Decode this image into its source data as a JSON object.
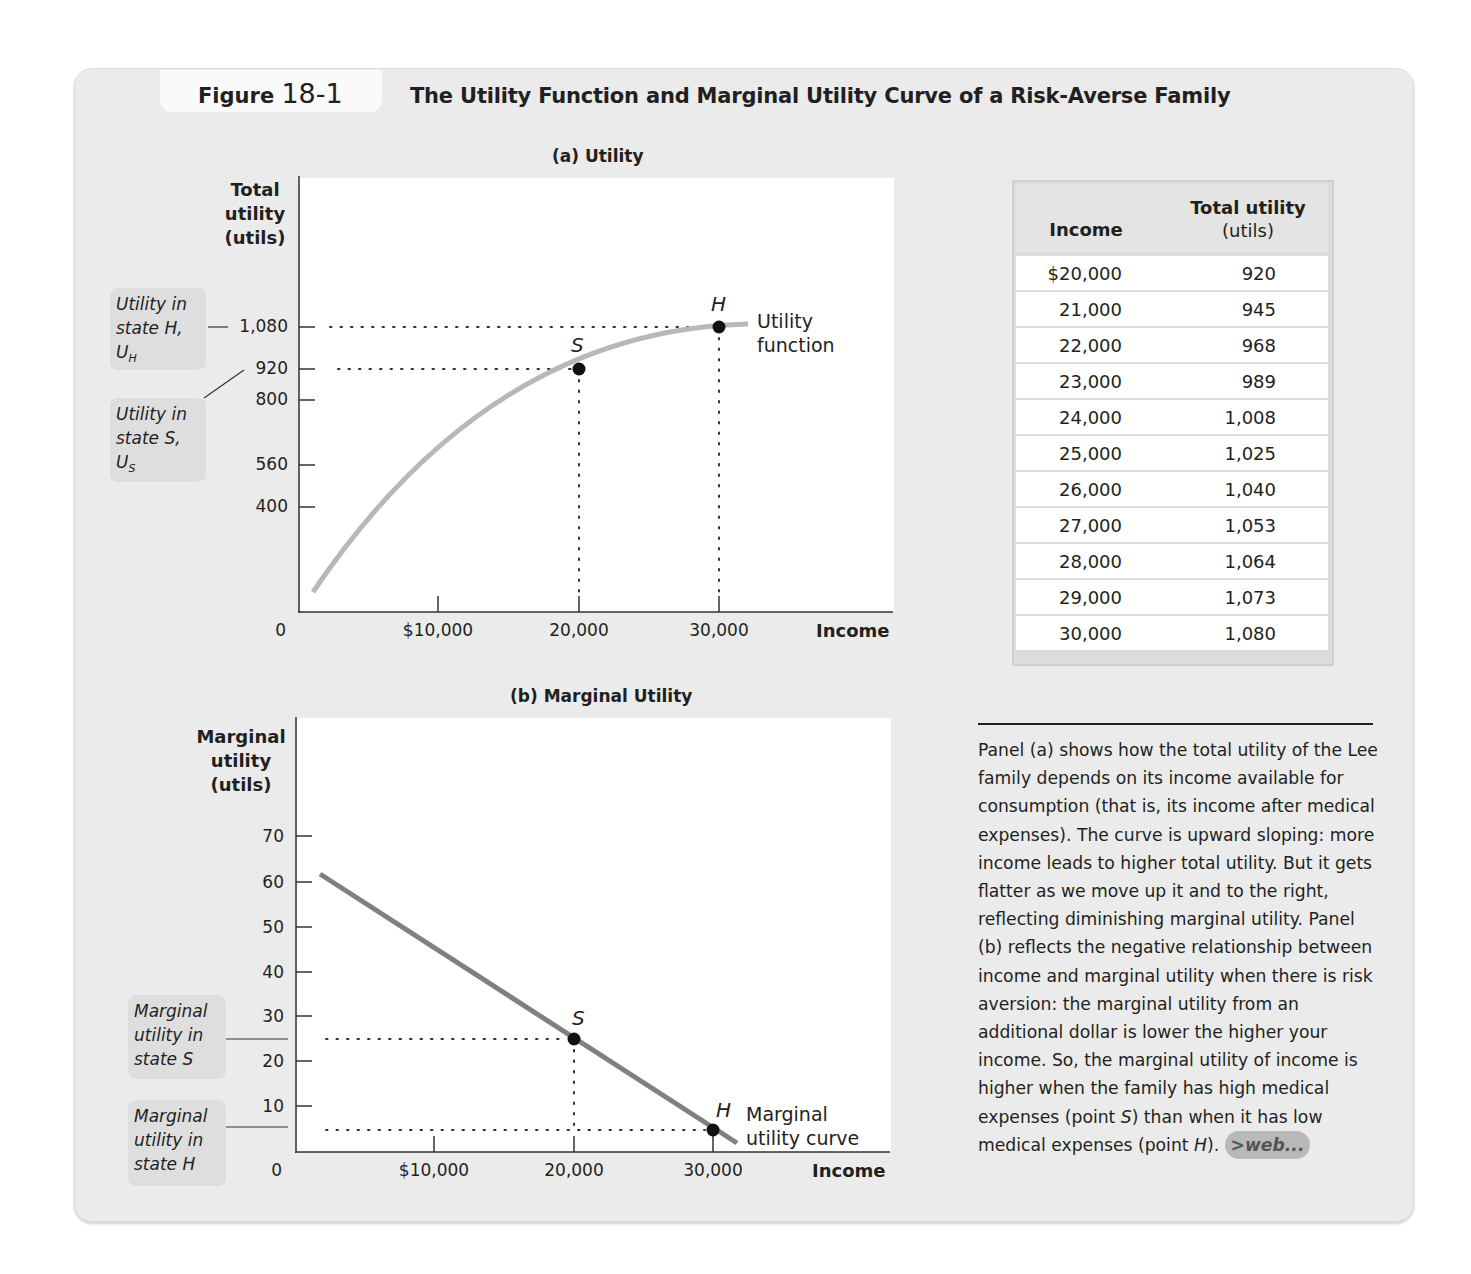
{
  "figure": {
    "label": "Figure",
    "number": "18-1",
    "title": "The Utility Function and Marginal Utility Curve of a Risk-Averse Family"
  },
  "panel_a": {
    "title": "(a) Utility",
    "y_axis_title": [
      "Total",
      "utility",
      "(utils)"
    ],
    "y_ticks": [
      "1,080",
      "920",
      "800",
      "560",
      "400"
    ],
    "origin": "0",
    "x_ticks": [
      "$10,000",
      "20,000",
      "30,000"
    ],
    "x_axis_title": "Income",
    "point_s": "S",
    "point_h": "H",
    "curve_label": [
      "Utility",
      "function"
    ],
    "callout_h": [
      "Utility in",
      "state H,",
      "U",
      "H"
    ],
    "callout_s": [
      "Utility in",
      "state S,",
      "U",
      "S"
    ]
  },
  "panel_b": {
    "title": "(b) Marginal Utility",
    "y_axis_title": [
      "Marginal",
      "utility",
      "(utils)"
    ],
    "y_ticks": [
      "70",
      "60",
      "50",
      "40",
      "30",
      "20",
      "10"
    ],
    "origin": "0",
    "x_ticks": [
      "$10,000",
      "20,000",
      "30,000"
    ],
    "x_axis_title": "Income",
    "point_s": "S",
    "point_h": "H",
    "curve_label": [
      "Marginal",
      "utility curve"
    ],
    "callout_s": [
      "Marginal",
      "utility in",
      "state S"
    ],
    "callout_h": [
      "Marginal",
      "utility in",
      "state H"
    ]
  },
  "table": {
    "headers": [
      "Income",
      "Total utility",
      "(utils)"
    ],
    "rows": [
      [
        "$20,000",
        "920"
      ],
      [
        "21,000",
        "945"
      ],
      [
        "22,000",
        "968"
      ],
      [
        "23,000",
        "989"
      ],
      [
        "24,000",
        "1,008"
      ],
      [
        "25,000",
        "1,025"
      ],
      [
        "26,000",
        "1,040"
      ],
      [
        "27,000",
        "1,053"
      ],
      [
        "28,000",
        "1,064"
      ],
      [
        "29,000",
        "1,073"
      ],
      [
        "30,000",
        "1,080"
      ]
    ]
  },
  "caption": {
    "part1": "Panel (a) shows how the total utility of the Lee family depends on its income available for consumption (that is, its income after medical expenses). The curve is upward sloping: more income leads to higher total utility. But it gets flatter as we move up it and to the right, reflecting diminishing marginal utility. Panel (b) reflects the negative relationship between income and marginal utility when there is risk aversion: the marginal utility from an additional dollar is lower the higher your income. So, the marginal utility of income is higher when the family has high medical expenses (point ",
    "s": "S",
    "part2": ") than when it has low medical expenses (point ",
    "h": "H",
    "part3": ").",
    "web_link": ">web..."
  },
  "colors": {
    "background": "#ebebeb",
    "curve_a": "#b8b8b8",
    "curve_b": "#808080",
    "point": "#111111"
  },
  "chart_data": [
    {
      "type": "line",
      "title": "(a) Utility",
      "xlabel": "Income",
      "ylabel": "Total utility (utils)",
      "x_ticks": [
        10000,
        20000,
        30000
      ],
      "y_ticks": [
        400,
        560,
        800,
        920,
        1080
      ],
      "series": [
        {
          "name": "Utility function",
          "x": [
            1000,
            5000,
            10000,
            15000,
            20000,
            25000,
            30000,
            32000
          ],
          "y": [
            150,
            380,
            590,
            770,
            920,
            1025,
            1080,
            1090
          ]
        }
      ],
      "points": [
        {
          "label": "S",
          "x": 20000,
          "y": 920
        },
        {
          "label": "H",
          "x": 30000,
          "y": 1080
        }
      ],
      "annotations": [
        "Utility in state H, U_H = 1,080",
        "Utility in state S, U_S = 920"
      ],
      "table": {
        "income": [
          20000,
          21000,
          22000,
          23000,
          24000,
          25000,
          26000,
          27000,
          28000,
          29000,
          30000
        ],
        "total_utility": [
          920,
          945,
          968,
          989,
          1008,
          1025,
          1040,
          1053,
          1064,
          1073,
          1080
        ]
      }
    },
    {
      "type": "line",
      "title": "(b) Marginal Utility",
      "xlabel": "Income",
      "ylabel": "Marginal utility (utils)",
      "x_ticks": [
        10000,
        20000,
        30000
      ],
      "y_ticks": [
        10,
        20,
        30,
        40,
        50,
        60,
        70
      ],
      "series": [
        {
          "name": "Marginal utility curve",
          "x": [
            1700,
            31700
          ],
          "y": [
            61.5,
            1.5
          ]
        }
      ],
      "points": [
        {
          "label": "S",
          "x": 20000,
          "y": 25
        },
        {
          "label": "H",
          "x": 30000,
          "y": 5
        }
      ],
      "annotations": [
        "Marginal utility in state S = 25",
        "Marginal utility in state H = 5"
      ]
    }
  ]
}
